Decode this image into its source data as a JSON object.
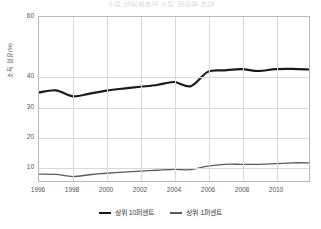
{
  "title_crop": "소득 상위계층의 소득 점유율 추이",
  "chart_data": {
    "type": "line",
    "title": "소득 상위계층의 소득 점유율 추이",
    "xlabel": "",
    "ylabel": "소득 점유(%)",
    "xlim": [
      1996,
      2012
    ],
    "ylim": [
      5,
      60
    ],
    "grid": true,
    "legend_position": "bottom",
    "xticks": [
      "1996",
      "1998",
      "2000",
      "2002",
      "2004",
      "2006",
      "2008",
      "2010"
    ],
    "xtick_values": [
      1996,
      1998,
      2000,
      2002,
      2004,
      2006,
      2008,
      2010
    ],
    "yticks": [
      "60",
      "40",
      "30",
      "20",
      "10"
    ],
    "ytick_values": [
      60,
      40,
      30,
      20,
      10
    ],
    "x": [
      1996,
      1997,
      1998,
      1999,
      2000,
      2001,
      2002,
      2003,
      2004,
      2005,
      2006,
      2007,
      2008,
      2009,
      2010,
      2011,
      2012
    ],
    "series": [
      {
        "name": "상위 10퍼센트",
        "color": "#1a1a1a",
        "width": 2.2,
        "values": [
          34.7,
          35.4,
          33.4,
          34.3,
          35.3,
          36.0,
          36.6,
          37.2,
          38.2,
          36.8,
          41.6,
          42.1,
          42.5,
          41.9,
          42.5,
          42.6,
          42.4
        ]
      },
      {
        "name": "상위 1퍼센트",
        "color": "#595959",
        "width": 1.3,
        "values": [
          7.3,
          7.2,
          6.5,
          7.1,
          7.6,
          8.0,
          8.3,
          8.6,
          8.9,
          8.8,
          10.0,
          10.6,
          10.6,
          10.6,
          10.8,
          11.1,
          11.1
        ]
      }
    ]
  }
}
